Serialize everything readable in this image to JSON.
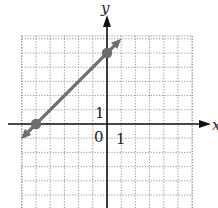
{
  "chart_data": {
    "type": "line",
    "title": "",
    "xlabel": "x",
    "ylabel": "y",
    "xlim": [
      -6,
      6
    ],
    "ylim": [
      -6,
      6.2
    ],
    "grid": true,
    "grid_style": "dotted",
    "tick_labels": {
      "origin": "0",
      "x_unit": "1",
      "y_unit": "1"
    },
    "series": [
      {
        "name": "line",
        "color": "#6e6e6e",
        "points": [
          {
            "x": -5,
            "y": 0
          },
          {
            "x": 0,
            "y": 5
          }
        ],
        "extends_both_directions": true,
        "equation": "y = x + 5"
      }
    ],
    "marked_points": [
      {
        "x": -5,
        "y": 0
      },
      {
        "x": 0,
        "y": 5
      }
    ]
  },
  "labels": {
    "x_axis": "x",
    "y_axis": "y",
    "origin": "0",
    "x_tick": "1",
    "y_tick": "1"
  },
  "colors": {
    "axis": "#111111",
    "grid": "#8a8a8a",
    "line": "#6e6e6e",
    "point": "#6e6e6e"
  }
}
